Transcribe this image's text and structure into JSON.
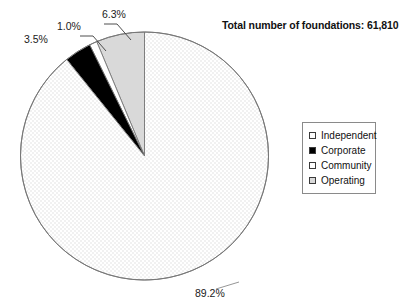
{
  "chart_data": {
    "type": "pie",
    "title": "Total number of foundations: 61,810",
    "total_label": "Total number of foundations:",
    "total_value": "61,810",
    "categories": [
      "Independent",
      "Corporate",
      "Community",
      "Operating"
    ],
    "values": [
      89.2,
      3.5,
      1.0,
      6.3
    ],
    "value_labels": [
      "89.2%",
      "3.5%",
      "1.0%",
      "6.3%"
    ],
    "unit": "%",
    "start_angle_deg": 90,
    "direction": "counterclockwise",
    "legend_position": "right",
    "grid": false,
    "xlabel": "",
    "ylabel": "",
    "slices": [
      {
        "name": "Operating",
        "value": 6.3,
        "label": "6.3%",
        "fill": "#d9d9d9",
        "pattern": "solid"
      },
      {
        "name": "Community",
        "value": 1.0,
        "label": "1.0%",
        "fill": "#ffffff",
        "pattern": "solid"
      },
      {
        "name": "Corporate",
        "value": 3.5,
        "label": "3.5%",
        "fill": "#000000",
        "pattern": "solid"
      },
      {
        "name": "Independent",
        "value": 89.2,
        "label": "89.2%",
        "fill": "#fcfcfc",
        "pattern": "fine-dots"
      }
    ]
  },
  "title": {
    "text": "Total number of foundations: 61,810"
  },
  "labels": {
    "operating": "6.3%",
    "community": "1.0%",
    "corporate": "3.5%",
    "independent": "89.2%"
  },
  "legend": {
    "items": [
      {
        "label": "Independent",
        "swatch": "#fdfdfd"
      },
      {
        "label": "Corporate",
        "swatch": "#000000"
      },
      {
        "label": "Community",
        "swatch": "#ffffff"
      },
      {
        "label": "Operating",
        "swatch": "#d9d9d9"
      }
    ]
  },
  "colors": {
    "outline": "#777777",
    "legend_border": "#8a8a8a",
    "text": "#111111",
    "background": "#ffffff"
  }
}
